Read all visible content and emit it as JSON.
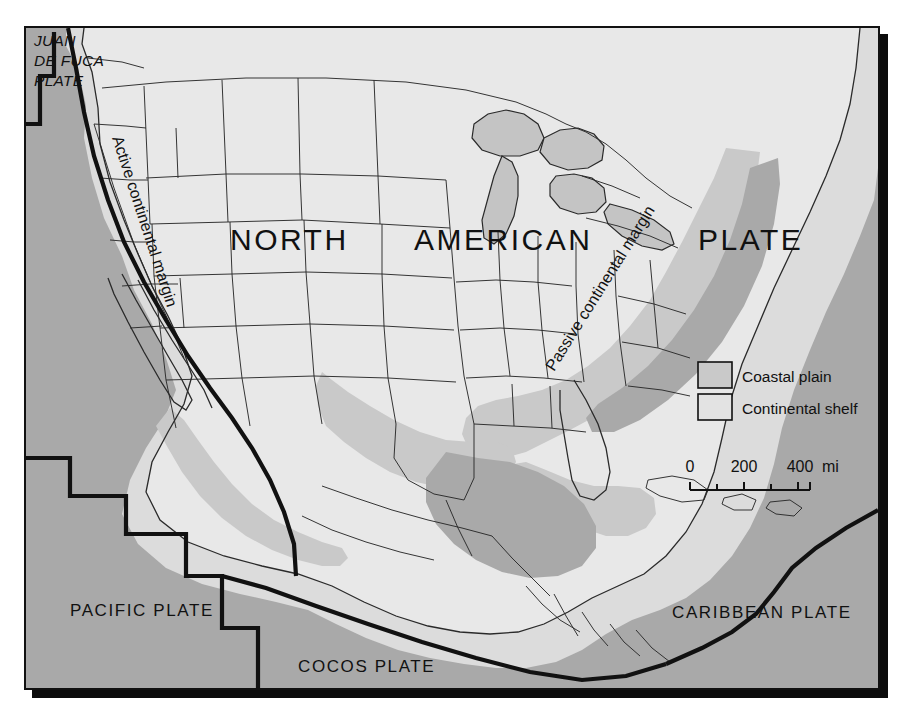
{
  "map": {
    "title_words": {
      "north": "NORTH",
      "american": "AMERICAN",
      "plate": "PLATE"
    },
    "plate_labels": [
      {
        "name": "juan-de-fuca",
        "line1": "JUAN",
        "line2": "DE FUCA",
        "line3": "PLATE"
      },
      {
        "name": "pacific",
        "text": "PACIFIC PLATE"
      },
      {
        "name": "cocos",
        "text": "COCOS PLATE"
      },
      {
        "name": "caribbean",
        "text": "CARIBBEAN PLATE"
      }
    ],
    "margin_labels": {
      "active": "Active continental margin",
      "passive": "Passive continental margin"
    },
    "legend": {
      "items": [
        {
          "label": "Coastal plain",
          "swatch": "#c9c9c9"
        },
        {
          "label": "Continental shelf",
          "swatch": "#dddddd"
        }
      ]
    },
    "scale": {
      "ticks": [
        "0",
        "200",
        "400"
      ],
      "unit": "mi"
    },
    "colors": {
      "ocean": "#a9a9a9",
      "land": "#e8e8e8",
      "continental_shelf": "#dcdcdc",
      "coastal_plain": "#c9c9c9",
      "lakes": "#c4c4c4",
      "outline": "#1a1a1a",
      "frame": "#111111",
      "shadow": "#0b0b0b",
      "paper": "#ffffff"
    }
  }
}
